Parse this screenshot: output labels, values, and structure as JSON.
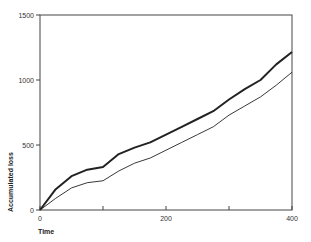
{
  "chart_data": {
    "type": "line",
    "title": "",
    "xlabel": "Time",
    "ylabel": "Accumulated loss",
    "xlim": [
      0,
      400
    ],
    "ylim": [
      0,
      1500
    ],
    "x_ticks": [
      0,
      100,
      200,
      300,
      400
    ],
    "x_tick_labels": [
      "0",
      "",
      "200",
      "",
      "400"
    ],
    "y_ticks": [
      0,
      500,
      1000,
      1500
    ],
    "y_tick_labels": [
      "0",
      "500",
      "1000",
      "1500"
    ],
    "grid": false,
    "legend": null,
    "series": [
      {
        "name": "upper (thick)",
        "x": [
          0,
          25,
          50,
          75,
          100,
          125,
          150,
          175,
          200,
          225,
          250,
          275,
          300,
          325,
          350,
          375,
          400
        ],
        "values": [
          0,
          160,
          260,
          310,
          330,
          430,
          480,
          520,
          580,
          640,
          700,
          760,
          850,
          930,
          1000,
          1120,
          1215
        ]
      },
      {
        "name": "lower (thin)",
        "x": [
          0,
          25,
          50,
          75,
          100,
          125,
          150,
          175,
          200,
          225,
          250,
          275,
          300,
          325,
          350,
          375,
          400
        ],
        "values": [
          0,
          90,
          170,
          210,
          225,
          300,
          360,
          400,
          460,
          520,
          580,
          640,
          730,
          800,
          870,
          960,
          1060
        ]
      }
    ]
  }
}
